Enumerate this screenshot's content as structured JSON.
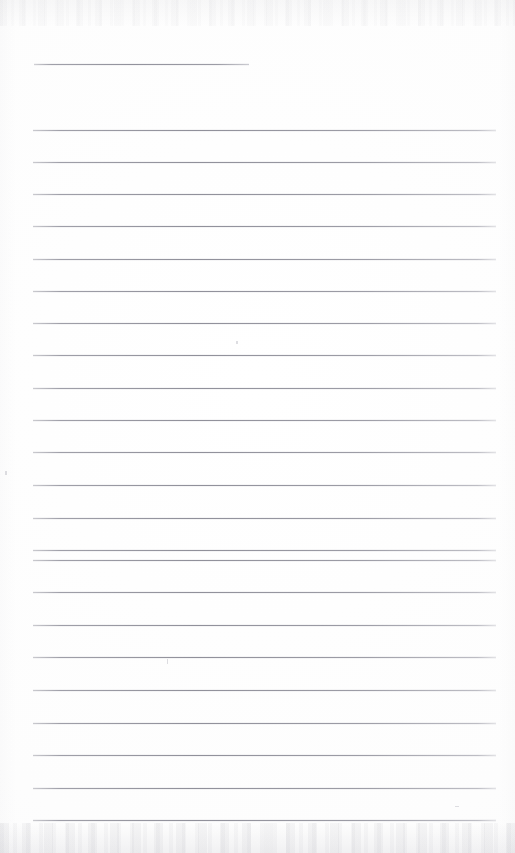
{
  "document": {
    "kind": "scanned-ruled-page",
    "title": "",
    "body_text": "",
    "page_width": 515,
    "page_height": 853,
    "background_color": "#fdfdfd",
    "rule_color": "#8e8e9a",
    "edge_shadow_color": "#b2b2ba"
  },
  "header_rule": {
    "label": "",
    "x_start": 34,
    "x_end": 249,
    "y": 64,
    "width": 215
  },
  "rules": {
    "x_start": 33,
    "x_end": 496,
    "width": 463,
    "spacing": 32.3,
    "count": 22,
    "y_positions": [
      130,
      162,
      194,
      226,
      259,
      291,
      323,
      355,
      388,
      420,
      452,
      485,
      518,
      550,
      560,
      592,
      625,
      657,
      690,
      723,
      755,
      788,
      820
    ]
  },
  "specks": [
    {
      "name": "speck-upper-mid",
      "x": 236,
      "y": 341,
      "w": 2,
      "h": 3
    },
    {
      "name": "speck-left-margin",
      "x": 5,
      "y": 471,
      "w": 2,
      "h": 4
    },
    {
      "name": "speck-tick-below-rule",
      "x": 167,
      "y": 659,
      "w": 1,
      "h": 5
    },
    {
      "name": "speck-right-lower",
      "x": 455,
      "y": 806,
      "w": 4,
      "h": 1
    }
  ],
  "annotations": {
    "content_note": "blank — no handwriting or printed text present",
    "lines_written": 0
  }
}
